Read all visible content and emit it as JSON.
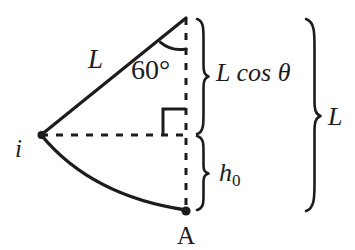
{
  "figure": {
    "type": "pendulum-geometry-diagram",
    "background_color": "#ffffff",
    "stroke_color": "#1c1c1c",
    "labels": {
      "string_length": "L",
      "angle": "60°",
      "pivot": "i",
      "lowest_point": "A",
      "vertical_drop": "L cos θ",
      "height_above_lowest": "h",
      "height_subscript": "0",
      "total_length": "L"
    },
    "geometry": {
      "pivot_point": {
        "x": 41,
        "y": 135
      },
      "apex_point": {
        "x": 186,
        "y": 18
      },
      "lowest_point": {
        "x": 186,
        "y": 211
      },
      "angle_degrees": 60,
      "angle_arc_radius": 30,
      "right_angle_marker": {
        "x": 163,
        "y": 107,
        "size": 23
      },
      "vertical_dashed_line": {
        "x": 186,
        "y_top": 18,
        "y_bottom": 211
      },
      "horizontal_dashed_line": {
        "y": 135,
        "x_left": 41,
        "x_right": 186
      },
      "arc_from_pivot_to_lowest": true
    },
    "braces": [
      {
        "name": "L-cos-theta-brace",
        "x": 198,
        "y_top": 18,
        "y_bottom": 135,
        "label": "L cos θ"
      },
      {
        "name": "h0-brace",
        "x": 198,
        "y_top": 135,
        "y_bottom": 211,
        "label": "h0"
      },
      {
        "name": "L-total-brace",
        "x": 312,
        "y_top": 18,
        "y_bottom": 211,
        "label": "L"
      }
    ]
  }
}
